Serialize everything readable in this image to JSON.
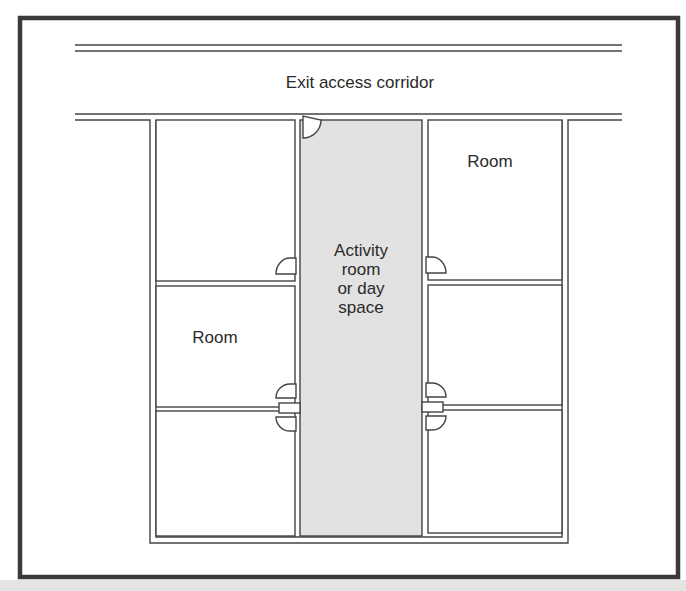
{
  "figure": {
    "type": "floor-plan",
    "colors": {
      "frame": "#3a3a3a",
      "wall": "#444444",
      "background": "#ffffff",
      "activity_fill": "#e2e2e2",
      "bottom_band": "#e4e4e4"
    }
  },
  "labels": {
    "corridor": "Exit access corridor",
    "room_top_right": "Room",
    "room_middle_left": "Room",
    "activity": "Activity\nroom\nor day\nspace"
  },
  "spaces": [
    {
      "id": "corridor",
      "label": "Exit access corridor"
    },
    {
      "id": "activity-room",
      "label": "Activity room or day space",
      "shaded": true
    },
    {
      "id": "left-room-1",
      "label": ""
    },
    {
      "id": "left-room-2",
      "label": "Room"
    },
    {
      "id": "left-room-3",
      "label": ""
    },
    {
      "id": "right-room-1",
      "label": "Room"
    },
    {
      "id": "right-room-2",
      "label": ""
    },
    {
      "id": "right-room-3",
      "label": ""
    }
  ],
  "doors": [
    {
      "id": "corridor-to-activity",
      "swing": "into activity room"
    },
    {
      "id": "left-room-1-door"
    },
    {
      "id": "left-room-2-door"
    },
    {
      "id": "left-room-3-door"
    },
    {
      "id": "right-room-1-door"
    },
    {
      "id": "right-room-2-door"
    },
    {
      "id": "right-room-3-door"
    }
  ]
}
